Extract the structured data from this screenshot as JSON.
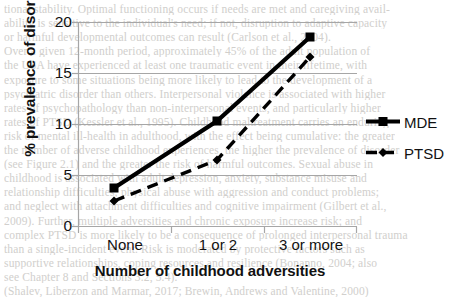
{
  "chart_data": {
    "type": "line",
    "title": "",
    "xlabel": "Number of childhood adversities",
    "ylabel": "% prevalence of disorder",
    "categories": [
      "None",
      "1 or 2",
      "3 or more"
    ],
    "series": [
      {
        "name": "MDE",
        "values": [
          3.8,
          10.4,
          18.6
        ],
        "line_style": "solid",
        "marker": "square",
        "color": "#000000"
      },
      {
        "name": "PTSD",
        "values": [
          2.5,
          6.5,
          16.6
        ],
        "line_style": "dashed",
        "marker": "diamond",
        "color": "#000000"
      }
    ],
    "yticks": [
      0,
      5,
      10,
      15,
      20
    ],
    "ylim": [
      0,
      20
    ],
    "grid": "horizontal",
    "legend_position": "right",
    "legend": [
      "MDE",
      "PTSD"
    ]
  },
  "axes": {
    "y_ticks": [
      "20",
      "15",
      "10",
      "5",
      "0"
    ],
    "x_ticks": [
      "None",
      "1 or 2",
      "3 or more"
    ],
    "y_title": "% prevalence of disorder",
    "x_title": "Number of childhood adversities"
  },
  "legend": {
    "mde_label": "MDE",
    "ptsd_label": "PTSD"
  },
  "background_text": {
    "lines": [
      "tional stability. Optimal functioning occurs if needs are met and caregiving avail-",
      "ability is sensitive to the individual's need; if not, disruption to adaptive capacity",
      "or harmful developmental outcomes can result (Carlson et al., 2004).",
      "Over a given 12-month period, approximately 45% of the adult population of",
      "the USA have experienced at least one traumatic event in their lifetime, with",
      "exposure to some situations being more likely to lead to the development of a",
      "psychiatric disorder than others. Interpersonal violence is associated with higher",
      "rates of psychopathology than non-interpersonal events, and particularly higher",
      "rates of PTSD (Kessler et al., 1995). Childhood maltreatment carries an enduring",
      "risk of mental ill-health in adulthood, with the effect being cumulative: the greater",
      "the number of adverse childhood experiences, the higher the prevalence of disorder",
      "(see Figure 2.1) and the greater the risk of harmful outcomes. Sexual abuse in",
      "childhood is associated with adult depression, anxiety, substance misuse and",
      "relationship difficulties; physical abuse with aggression and conduct problems;",
      "and neglect with attachment difficulties and cognitive impairment (Gilbert et al.,",
      "2009). Further, multiple adversities and chronic exposure increase risk; and",
      "complex PTSD is more likely to be a consequence of prolonged interpersonal trauma",
      "than a single-incident event. Risk is moderated by protective factors such as",
      "supportive relationships, coping resources and resilience (Bonanno, 2004; also",
      "see Chapter 8 and Sections 3.2, 5.4).",
      "(Shalev, Liberzon and Marmar, 2017; Brewin, Andrews and Valentine, 2000)"
    ]
  }
}
